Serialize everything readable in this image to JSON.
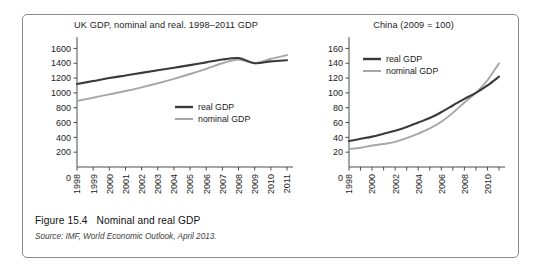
{
  "figure": {
    "caption_label": "Figure 15.4",
    "caption_text": "Nominal and real GDP",
    "source_text": "Source: IMF, World Economic Outlook, April 2013."
  },
  "colors": {
    "real_gdp_line": "#3a3a3a",
    "nominal_gdp_line": "#a6a6a6",
    "axis": "#4d4d4d",
    "frame_border": "#8c8c8c",
    "background": "#ffffff"
  },
  "chart_data": [
    {
      "id": "uk",
      "type": "line",
      "title": "UK GDP, nominal and real. 1998–2011 GDP",
      "xlabel": "",
      "ylabel": "",
      "x": [
        1998,
        1999,
        2000,
        2001,
        2002,
        2003,
        2004,
        2005,
        2006,
        2007,
        2008,
        2009,
        2010,
        2011
      ],
      "tick_labels_x": [
        "1998",
        "1999",
        "2000",
        "2001",
        "2002",
        "2003",
        "2004",
        "2005",
        "2006",
        "2007",
        "2008",
        "2009",
        "2010",
        "2011"
      ],
      "ticks_y": [
        0,
        200,
        400,
        600,
        800,
        1000,
        1200,
        1400,
        1600
      ],
      "ylim": [
        0,
        1700
      ],
      "grid": false,
      "legend_position": "inside-lower-right",
      "series": [
        {
          "name": "real GDP",
          "color": "#3a3a3a",
          "values": [
            1120,
            1160,
            1200,
            1235,
            1270,
            1305,
            1340,
            1375,
            1412,
            1450,
            1470,
            1400,
            1425,
            1440
          ]
        },
        {
          "name": "nominal GDP",
          "color": "#a6a6a6",
          "values": [
            890,
            935,
            980,
            1025,
            1075,
            1130,
            1190,
            1255,
            1325,
            1400,
            1450,
            1400,
            1460,
            1510
          ]
        }
      ]
    },
    {
      "id": "china",
      "type": "line",
      "title": "China (2009 = 100)",
      "xlabel": "",
      "ylabel": "",
      "x": [
        1998,
        1999,
        2000,
        2001,
        2002,
        2003,
        2004,
        2005,
        2006,
        2007,
        2008,
        2009,
        2010,
        2011
      ],
      "tick_labels_x": [
        "1998",
        "2000",
        "2002",
        "2004",
        "2006",
        "2008",
        "2010"
      ],
      "ticks_y": [
        0,
        20,
        40,
        60,
        80,
        100,
        120,
        140,
        160
      ],
      "ylim": [
        0,
        170
      ],
      "grid": false,
      "legend_position": "inside-upper-left",
      "series": [
        {
          "name": "real GDP",
          "color": "#3a3a3a",
          "values": [
            35,
            38,
            41,
            45,
            49,
            54,
            60,
            66,
            74,
            83,
            92,
            100,
            110,
            122
          ]
        },
        {
          "name": "nominal GDP",
          "color": "#a6a6a6",
          "values": [
            24,
            26,
            29,
            31,
            34,
            39,
            45,
            52,
            61,
            73,
            87,
            100,
            117,
            140
          ]
        }
      ]
    }
  ]
}
